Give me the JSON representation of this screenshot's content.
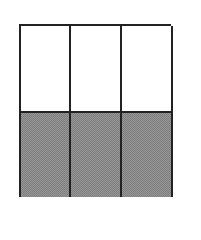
{
  "diagram": {
    "type": "fraction-area-model",
    "columns": 3,
    "rows": 2,
    "colors": {
      "border": "#222222",
      "unshaded": "#ffffff",
      "shaded": "#888888"
    },
    "cells": [
      {
        "row": 0,
        "col": 0,
        "shaded": false
      },
      {
        "row": 0,
        "col": 1,
        "shaded": false
      },
      {
        "row": 0,
        "col": 2,
        "shaded": false
      },
      {
        "row": 1,
        "col": 0,
        "shaded": true
      },
      {
        "row": 1,
        "col": 1,
        "shaded": true
      },
      {
        "row": 1,
        "col": 2,
        "shaded": true
      }
    ],
    "shaded_count": 3,
    "total_count": 6
  }
}
